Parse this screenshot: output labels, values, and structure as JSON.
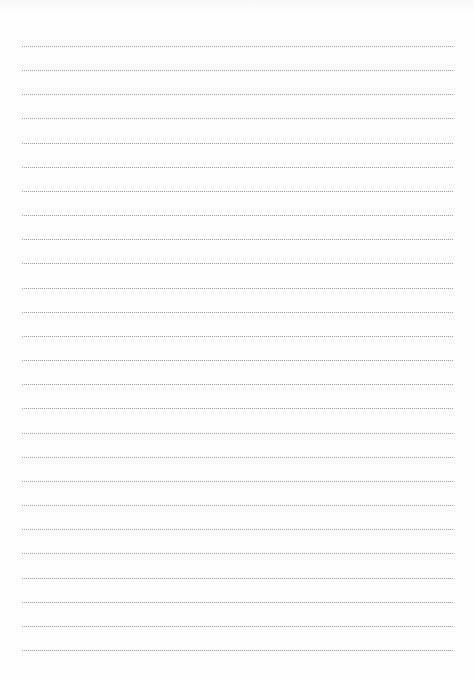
{
  "page": {
    "type": "lined-paper",
    "background_color": "#fefefe",
    "rule_color": "#9a9a9a",
    "rule_style": "dotted",
    "rule_count": 26,
    "first_rule_y": 46,
    "rule_spacing": 24.16,
    "rule_left": 22,
    "rule_right": 453
  }
}
